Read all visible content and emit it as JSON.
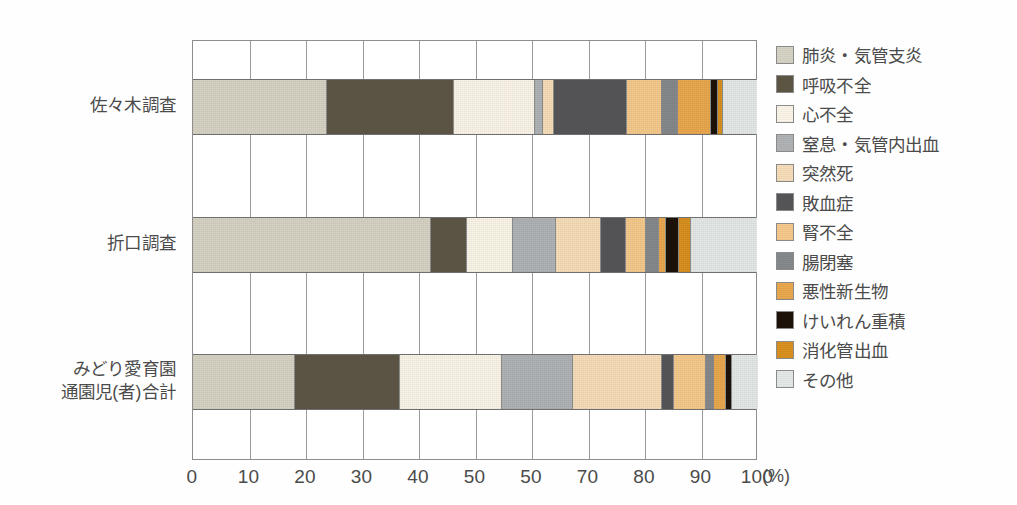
{
  "chart_data": {
    "type": "bar",
    "orientation": "horizontal",
    "stacked": true,
    "normalized_percent": true,
    "title": "",
    "xlabel": "(%)",
    "ylabel": "",
    "xlim": [
      0,
      100
    ],
    "xticks": [
      0,
      10,
      20,
      30,
      40,
      50,
      60,
      70,
      80,
      90,
      100
    ],
    "xtick_labels": [
      "0",
      "10",
      "20",
      "30",
      "40",
      "50",
      "50",
      "70",
      "80",
      "90",
      "100"
    ],
    "x_unit": "(%)",
    "grid": true,
    "legend_position": "right",
    "categories": [
      "佐々木調査",
      "折口調査",
      "みどり愛育園通園児(者)合計"
    ],
    "category_label_lines": [
      [
        "佐々木調査"
      ],
      [
        "折口調査"
      ],
      [
        "みどり愛育園",
        "通園児(者)合計"
      ]
    ],
    "series": [
      {
        "name": "肺炎・気管支炎",
        "color": "#d6d2c4",
        "values": [
          23.5,
          42.0,
          17.9
        ]
      },
      {
        "name": "呼吸不全",
        "color": "#5e5645",
        "values": [
          22.5,
          6.4,
          18.6
        ]
      },
      {
        "name": "心不全",
        "color": "#fbf5e8",
        "values": [
          14.3,
          8.0,
          18.1
        ]
      },
      {
        "name": "窒息・気管内出血",
        "color": "#b0b3b5",
        "values": [
          1.4,
          7.6,
          12.4
        ]
      },
      {
        "name": "突然死",
        "color": "#f7ddb8",
        "values": [
          2.0,
          8.1,
          15.9
        ]
      },
      {
        "name": "敗血症",
        "color": "#565659",
        "values": [
          12.9,
          4.4,
          2.1
        ]
      },
      {
        "name": "腎不全",
        "color": "#f5c98c",
        "values": [
          6.2,
          3.5,
          5.7
        ]
      },
      {
        "name": "腸閉塞",
        "color": "#86898c",
        "values": [
          2.8,
          2.3,
          1.4
        ]
      },
      {
        "name": "悪性新生物",
        "color": "#e9a84e",
        "values": [
          6.0,
          1.2,
          2.0
        ]
      },
      {
        "name": "けいれん重積",
        "color": "#1c1208",
        "values": [
          1.1,
          2.3,
          1.2
        ]
      },
      {
        "name": "消化管出血",
        "color": "#d8901f",
        "values": [
          1.0,
          2.1,
          0.0
        ]
      },
      {
        "name": "その他",
        "color": "#e4e9e8",
        "values": [
          6.2,
          11.9,
          4.7
        ]
      }
    ]
  }
}
